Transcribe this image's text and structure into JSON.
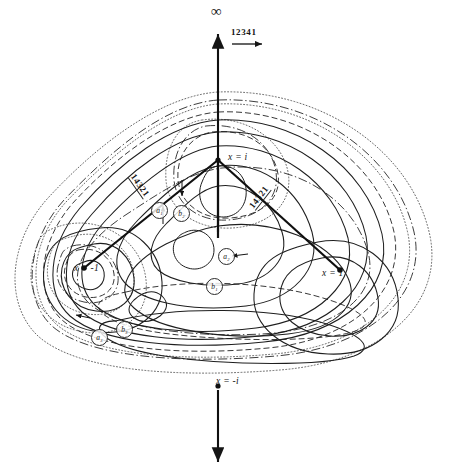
{
  "figure": {
    "type": "riemann-surface-branch-diagram",
    "background": "#ffffff",
    "ink": "#1a1a1a"
  },
  "nodes": [
    {
      "id": "infinity",
      "label": "∞",
      "x": 218,
      "y": 12
    },
    {
      "id": "branch-i",
      "label": "x = i",
      "x": 228,
      "y": 157
    },
    {
      "id": "branch-minus-one",
      "label": "x = -1",
      "x": 80,
      "y": 268
    },
    {
      "id": "branch-one",
      "label": "x = 1",
      "x": 327,
      "y": 273
    },
    {
      "id": "branch-minus-i",
      "label": "x = -i",
      "x": 222,
      "y": 381
    }
  ],
  "permutations": [
    {
      "id": "perm-infinity",
      "label": "12341",
      "x": 233,
      "y": 33,
      "orientation": "horizontal"
    },
    {
      "id": "perm-left-branch",
      "label": "14321",
      "x": 139,
      "y": 176,
      "orientation": "rotated-55"
    },
    {
      "id": "perm-right-branch",
      "label": "14321",
      "x": 249,
      "y": 206,
      "orientation": "rotated-minus-52"
    }
  ],
  "loop_labels": [
    {
      "id": "a1",
      "label": "a₁",
      "x": 157,
      "y": 207
    },
    {
      "id": "b2",
      "label": "b₂",
      "x": 179,
      "y": 210
    },
    {
      "id": "a2",
      "label": "a₂",
      "x": 224,
      "y": 253
    },
    {
      "id": "b1",
      "label": "b₁",
      "x": 212,
      "y": 283
    },
    {
      "id": "a3",
      "label": "a₃",
      "x": 97,
      "y": 334
    },
    {
      "id": "b3",
      "label": "b₃",
      "x": 122,
      "y": 326
    }
  ],
  "arrows": [
    {
      "id": "arrow-to-infinity",
      "direction": "up",
      "from": [
        218,
        230
      ],
      "to": [
        218,
        30
      ]
    },
    {
      "id": "arrow-to-minus-i",
      "direction": "down",
      "from": [
        218,
        388
      ],
      "to": [
        218,
        466
      ]
    },
    {
      "id": "arrow-perm-infinity",
      "direction": "right",
      "from": [
        233,
        44
      ],
      "to": [
        266,
        44
      ]
    }
  ],
  "line_styles": {
    "solid": "continuous closed curves",
    "dashed": "dashed closed curves",
    "dash_dot": "dash-dot closed curves",
    "dotted": "dotted outermost closed curves"
  }
}
